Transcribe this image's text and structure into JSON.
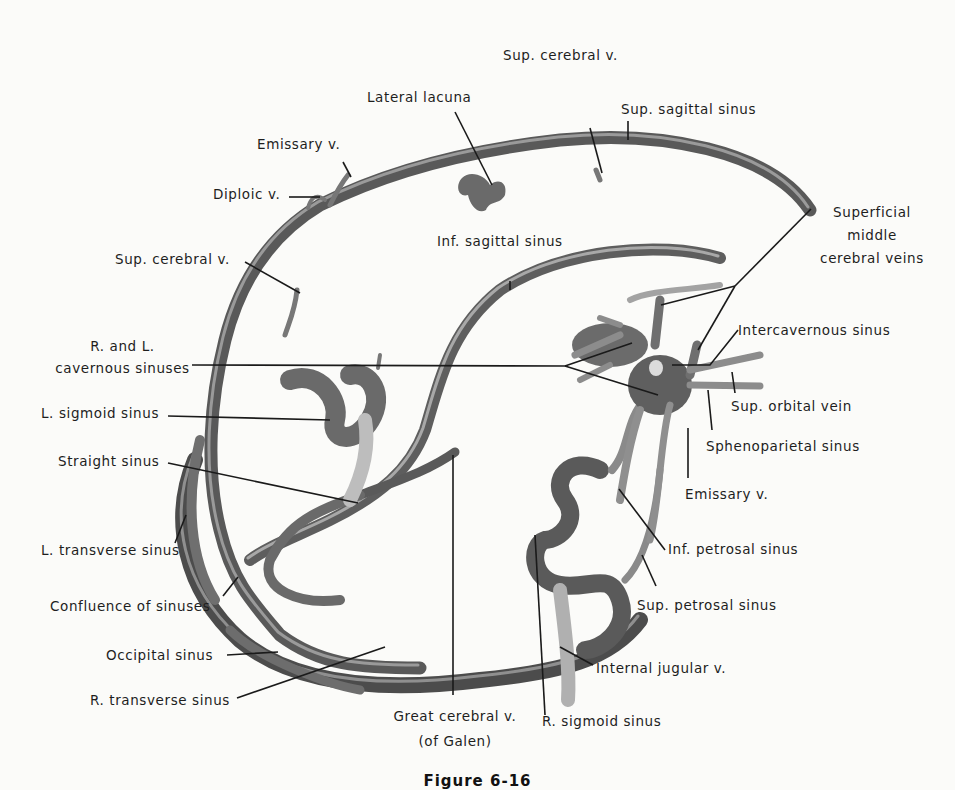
{
  "figure": {
    "caption": "Figure 6-16",
    "colors": {
      "background": "#fbfbf9",
      "vessel_dark": "#4a4a4a",
      "vessel_mid": "#7d7d7d",
      "vessel_light": "#b9b9b9",
      "leader_line": "#1a1a1a",
      "label_text": "#1e1e1e"
    }
  },
  "labels": {
    "sup_cerebral_v_top": "Sup. cerebral v.",
    "lateral_lacuna": "Lateral lacuna",
    "sup_sagittal_sinus": "Sup. sagittal sinus",
    "emissary_v_top": "Emissary v.",
    "diploic_v": "Diploic v.",
    "superficial_middle_cerebral_veins": [
      "Superficial",
      "middle",
      "cerebral veins"
    ],
    "inf_sagittal_sinus": "Inf. sagittal sinus",
    "sup_cerebral_v_left": "Sup. cerebral v.",
    "intercavernous_sinus": "Intercavernous sinus",
    "cavernous_sinuses": [
      "R. and L.",
      "cavernous sinuses"
    ],
    "l_sigmoid_sinus": "L. sigmoid sinus",
    "sup_orbital_vein": "Sup. orbital vein",
    "sphenoparietal_sinus": "Sphenoparietal sinus",
    "straight_sinus": "Straight sinus",
    "emissary_v_right": "Emissary v.",
    "l_transverse_sinus": "L. transverse sinus",
    "inf_petrosal_sinus": "Inf. petrosal sinus",
    "confluence_of_sinuses": "Confluence of sinuses",
    "sup_petrosal_sinus": "Sup. petrosal sinus",
    "occipital_sinus": "Occipital sinus",
    "internal_jugular_v": "Internal jugular v.",
    "r_transverse_sinus": "R. transverse sinus",
    "great_cerebral_v": [
      "Great cerebral v.",
      "(of Galen)"
    ],
    "r_sigmoid_sinus": "R. sigmoid sinus"
  }
}
